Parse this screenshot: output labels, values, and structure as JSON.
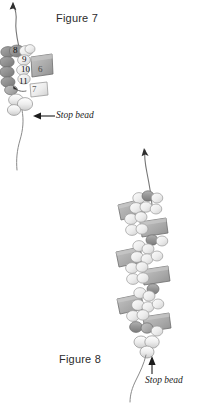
{
  "document": {
    "type": "beading-instruction-diagram",
    "background_color": "#ffffff"
  },
  "figures": [
    {
      "id": "figure-7",
      "caption": "Figure 7",
      "annotation": "Stop bead",
      "arrow_direction": "left",
      "bead_numbers": [
        "8",
        "9",
        "10",
        "11",
        "6",
        "7"
      ],
      "colors": {
        "dark_bead": "#8e8e8e",
        "mid_bead": "#a8a8a8",
        "light_bead": "#e8e8e8",
        "outline": "#6b6b6b",
        "thread": "#7a7a7a"
      }
    },
    {
      "id": "figure-8",
      "caption": "Figure 8",
      "annotation": "Stop bead",
      "arrow_direction": "up",
      "bead_numbers": [],
      "colors": {
        "dark_bead": "#919191",
        "mid_bead": "#b5b5b5",
        "light_bead": "#ededed",
        "outline": "#6b6b6b",
        "thread": "#7a7a7a"
      }
    }
  ],
  "bead_labels": {
    "n6": "6",
    "n7": "7",
    "n8": "8",
    "n9": "9",
    "n10": "10",
    "n11": "11"
  }
}
